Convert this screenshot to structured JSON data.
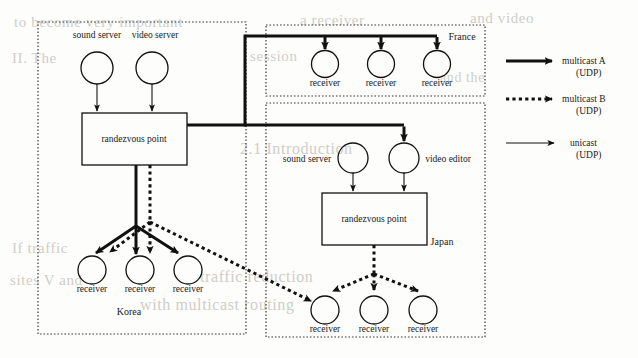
{
  "figure": {
    "colors": {
      "ink": "#1a1a1a",
      "line": "#111111",
      "paper": "#fdfdfb",
      "bleed": "#cfcdc9"
    },
    "regions": [
      {
        "id": "korea",
        "label": "Korea",
        "x": 38,
        "y": 22,
        "w": 208,
        "h": 312
      },
      {
        "id": "france",
        "label": "France",
        "x": 266,
        "y": 25,
        "w": 219,
        "h": 71
      },
      {
        "id": "japan",
        "label": "Japan",
        "x": 266,
        "y": 103,
        "w": 219,
        "h": 234
      }
    ],
    "korea": {
      "sound_server_label": "sound server",
      "video_server_label": "video server",
      "rendezvous_label": "randezvous point",
      "region_label": "Korea",
      "receivers": [
        "receiver",
        "receiver",
        "receiver"
      ]
    },
    "france": {
      "region_label": "France",
      "receivers": [
        "receiver",
        "receiver",
        "receiver"
      ]
    },
    "japan": {
      "sound_server_label": "sound server",
      "video_editor_label": "video editor",
      "rendezvous_label": "randezvous point",
      "region_label": "Japan",
      "receivers": [
        "receiver",
        "receiver",
        "receiver"
      ]
    },
    "legend": {
      "items": [
        {
          "id": "multicast-a",
          "style": "thick-solid",
          "line1": "multicast A",
          "line2": "(UDP)"
        },
        {
          "id": "multicast-b",
          "style": "dotted",
          "line1": "multicast B",
          "line2": "(UDP)"
        },
        {
          "id": "unicast",
          "style": "thin-solid",
          "line1": "unicast",
          "line2": "(UDP)"
        }
      ]
    },
    "bleed_text": [
      {
        "text": "to become very important",
        "x": 14,
        "y": 14,
        "size": 15
      },
      {
        "text": "a receiver",
        "x": 300,
        "y": 12,
        "size": 15
      },
      {
        "text": "and video",
        "x": 470,
        "y": 10,
        "size": 15
      },
      {
        "text": "II. The",
        "x": 12,
        "y": 50,
        "size": 15
      },
      {
        "text": "session",
        "x": 250,
        "y": 48,
        "size": 15
      },
      {
        "text": "and the",
        "x": 440,
        "y": 70,
        "size": 14
      },
      {
        "text": "2.1  Introduction",
        "x": 240,
        "y": 140,
        "size": 16
      },
      {
        "text": "If traffic",
        "x": 12,
        "y": 240,
        "size": 15
      },
      {
        "text": "sites  V  and",
        "x": 10,
        "y": 272,
        "size": 15
      },
      {
        "text": "traffic   reduction",
        "x": 200,
        "y": 268,
        "size": 16
      },
      {
        "text": "with   multicast  routing",
        "x": 140,
        "y": 296,
        "size": 16
      }
    ]
  }
}
